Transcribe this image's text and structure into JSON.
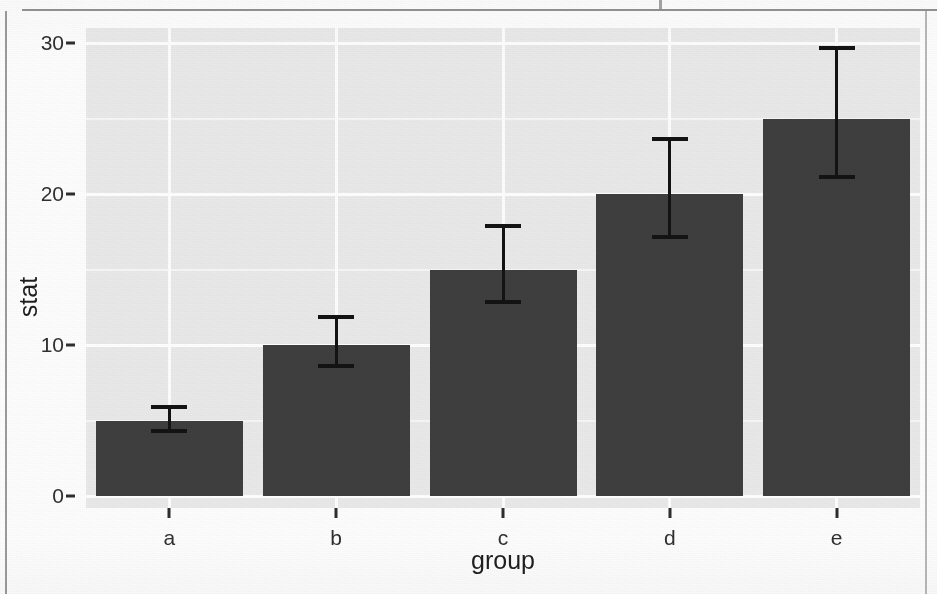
{
  "chart_data": {
    "type": "bar",
    "title": "",
    "subtitle": "",
    "xlabel": "group",
    "ylabel": "stat",
    "categories": [
      "a",
      "b",
      "c",
      "d",
      "e"
    ],
    "values": [
      5,
      10,
      15,
      20,
      25
    ],
    "series": [
      {
        "name": "stat",
        "values": [
          5,
          10,
          15,
          20,
          25
        ],
        "error_low": [
          4.2,
          8.5,
          12.7,
          17.0,
          21.0
        ],
        "error_high": [
          6.0,
          12.0,
          18.0,
          23.8,
          29.8
        ]
      }
    ],
    "ylim": [
      0,
      31.8
    ],
    "xlim_categories": [
      "a",
      "b",
      "c",
      "d",
      "e"
    ],
    "y_ticks": [
      0,
      10,
      20,
      30
    ],
    "y_tick_labels": [
      "0",
      "10",
      "20",
      "30"
    ],
    "y_minor_ticks": [
      5,
      15,
      25
    ],
    "x_ticks": [
      "a",
      "b",
      "c",
      "d",
      "e"
    ],
    "grid": true,
    "grid_major_color": "#ffffff",
    "grid_minor_color": "#f5f5f5",
    "legend": null,
    "legend_position": "none",
    "bar_color": "#3e3e3e",
    "errorbar_color": "#131313",
    "panel_background": "#e9e9e9",
    "page_background": "#fdfdfd",
    "axis_text_color": "#303030",
    "annotations": []
  },
  "axes": {
    "y_label": "stat",
    "x_label": "group",
    "y_tick_labels": [
      "30",
      "20",
      "10",
      "0"
    ],
    "x_tick_labels": [
      "a",
      "b",
      "c",
      "d",
      "e"
    ]
  }
}
